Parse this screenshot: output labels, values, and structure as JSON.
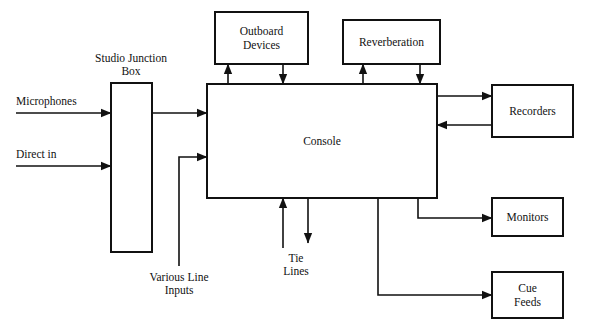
{
  "diagram": {
    "canvas": {
      "width": 590,
      "height": 333
    },
    "stroke_color": "#111111",
    "fill_color": "#ffffff",
    "boxes": [
      {
        "id": "outboard-devices",
        "label_lines": [
          "Outboard",
          "Devices"
        ],
        "x": 215,
        "y": 12,
        "w": 93,
        "h": 52
      },
      {
        "id": "reverberation",
        "label_lines": [
          "Reverberation"
        ],
        "x": 343,
        "y": 20,
        "w": 97,
        "h": 44
      },
      {
        "id": "studio-junction-box",
        "label_lines": [],
        "x": 111,
        "y": 83,
        "w": 41,
        "h": 169
      },
      {
        "id": "console",
        "label_lines": [
          "Console"
        ],
        "x": 207,
        "y": 84,
        "w": 230,
        "h": 114
      },
      {
        "id": "recorders",
        "label_lines": [
          "Recorders"
        ],
        "x": 492,
        "y": 85,
        "w": 81,
        "h": 52
      },
      {
        "id": "monitors",
        "label_lines": [
          "Monitors"
        ],
        "x": 492,
        "y": 198,
        "w": 71,
        "h": 38
      },
      {
        "id": "cue-feeds",
        "label_lines": [
          "Cue",
          "Feeds"
        ],
        "x": 492,
        "y": 272,
        "w": 71,
        "h": 46
      }
    ],
    "free_labels": [
      {
        "id": "studio-junction-box-label",
        "lines": [
          "Studio Junction",
          "Box"
        ],
        "x": 131,
        "y": 62,
        "anchor": "middle",
        "line_height": 13
      },
      {
        "id": "microphones-label",
        "lines": [
          "Microphones"
        ],
        "x": 16,
        "y": 105,
        "anchor": "start",
        "line_height": 13
      },
      {
        "id": "direct-in-label",
        "lines": [
          "Direct in"
        ],
        "x": 16,
        "y": 158,
        "anchor": "start",
        "line_height": 13
      },
      {
        "id": "various-line-inputs-label",
        "lines": [
          "Various Line",
          "Inputs"
        ],
        "x": 179,
        "y": 281,
        "anchor": "middle",
        "line_height": 13
      },
      {
        "id": "tie-lines-label",
        "lines": [
          "Tie",
          "Lines"
        ],
        "x": 296,
        "y": 262,
        "anchor": "middle",
        "line_height": 13
      }
    ],
    "connections": [
      {
        "id": "microphones-to-junction-box",
        "from": "microphones-source",
        "to": "studio-junction-box",
        "points": [
          [
            16,
            113
          ],
          [
            111,
            113
          ]
        ],
        "arrow_end": true
      },
      {
        "id": "direct-in-to-junction-box",
        "from": "direct-in-source",
        "to": "studio-junction-box",
        "points": [
          [
            16,
            166
          ],
          [
            111,
            166
          ]
        ],
        "arrow_end": true
      },
      {
        "id": "junction-box-to-console",
        "from": "studio-junction-box",
        "to": "console",
        "points": [
          [
            152,
            113
          ],
          [
            207,
            113
          ]
        ],
        "arrow_end": true
      },
      {
        "id": "various-line-inputs-to-console",
        "from": "various-line-inputs",
        "to": "console",
        "points": [
          [
            179,
            266
          ],
          [
            179,
            157
          ],
          [
            207,
            157
          ]
        ],
        "arrow_end": true
      },
      {
        "id": "console-to-outboard-devices",
        "from": "console",
        "to": "outboard-devices",
        "points": [
          [
            228,
            84
          ],
          [
            228,
            64
          ]
        ],
        "arrow_end": true
      },
      {
        "id": "outboard-devices-to-console",
        "from": "outboard-devices",
        "to": "console",
        "points": [
          [
            283,
            64
          ],
          [
            283,
            84
          ]
        ],
        "arrow_end": true
      },
      {
        "id": "console-to-reverberation",
        "from": "console",
        "to": "reverberation",
        "points": [
          [
            363,
            84
          ],
          [
            363,
            64
          ]
        ],
        "arrow_end": true
      },
      {
        "id": "reverberation-to-console",
        "from": "reverberation",
        "to": "console",
        "points": [
          [
            420,
            64
          ],
          [
            420,
            84
          ]
        ],
        "arrow_end": true
      },
      {
        "id": "console-to-recorders",
        "from": "console",
        "to": "recorders",
        "points": [
          [
            437,
            96
          ],
          [
            492,
            96
          ]
        ],
        "arrow_end": true
      },
      {
        "id": "recorders-to-console",
        "from": "recorders",
        "to": "console",
        "points": [
          [
            492,
            125
          ],
          [
            437,
            125
          ]
        ],
        "arrow_end": true
      },
      {
        "id": "console-to-monitors",
        "from": "console",
        "to": "monitors",
        "points": [
          [
            418,
            198
          ],
          [
            418,
            218
          ],
          [
            492,
            218
          ]
        ],
        "arrow_end": true
      },
      {
        "id": "console-to-cue-feeds",
        "from": "console",
        "to": "cue-feeds",
        "points": [
          [
            378,
            198
          ],
          [
            378,
            295
          ],
          [
            492,
            295
          ]
        ],
        "arrow_end": true
      },
      {
        "id": "tie-lines-into-console",
        "from": "tie-lines",
        "to": "console",
        "points": [
          [
            283,
            248
          ],
          [
            283,
            198
          ]
        ],
        "arrow_end": true
      },
      {
        "id": "console-to-tie-lines",
        "from": "console",
        "to": "tie-lines",
        "points": [
          [
            308,
            198
          ],
          [
            308,
            243
          ]
        ],
        "arrow_end": true
      }
    ]
  }
}
